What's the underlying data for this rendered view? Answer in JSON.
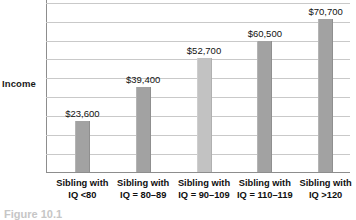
{
  "figure": {
    "y_axis_label": "Income",
    "caption": "Figure 10.1",
    "bar_color": "#a2a2a2",
    "bar_color_light": "#c2c2c2",
    "gridline_color": "#c9c9c9",
    "axis_color": "#8d8d8d"
  },
  "chart_data": {
    "type": "bar",
    "title": "",
    "xlabel": "",
    "ylabel": "Income",
    "categories": [
      "Sibling with IQ <80",
      "Sibling with IQ = 80–89",
      "Sibling with IQ = 90–109",
      "Sibling with IQ = 110–119",
      "Sibling with IQ >120"
    ],
    "category_lines": [
      {
        "line1": "Sibling with",
        "line2": "IQ <80"
      },
      {
        "line1": "Sibling with",
        "line2": "IQ = 80–89"
      },
      {
        "line1": "Sibling with",
        "line2": "IQ = 90–109"
      },
      {
        "line1": "Sibling with",
        "line2": "IQ = 110–119"
      },
      {
        "line1": "Sibling with",
        "line2": "IQ >120"
      }
    ],
    "values": [
      23600,
      39400,
      52700,
      60500,
      70700
    ],
    "value_labels": [
      "$23,600",
      "$39,400",
      "$52,700",
      "$60,500",
      "$70,700"
    ],
    "ylim": [
      0,
      80000
    ],
    "grid": true,
    "gridline_step": 8750,
    "legend": "none"
  }
}
